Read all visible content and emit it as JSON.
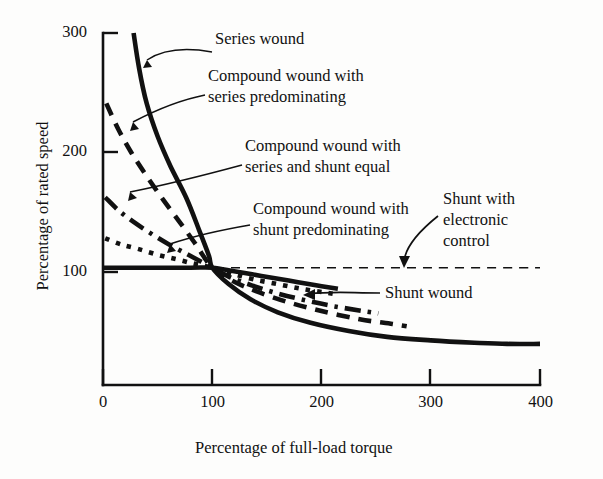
{
  "figure": {
    "background_color": "#fdfdfc",
    "ink_color": "#111111"
  },
  "chart_data": {
    "type": "line",
    "title": "",
    "xlabel": "Percentage of full-load torque",
    "ylabel": "Percentage of rated speed",
    "xlim": [
      0,
      400
    ],
    "ylim": [
      0,
      300
    ],
    "xticks": [
      0,
      100,
      200,
      300,
      400
    ],
    "yticks": [
      100,
      200,
      300
    ],
    "grid": false,
    "legend_position": "inline-annotations",
    "series": [
      {
        "name": "Series wound",
        "style": "solid",
        "width": "thick",
        "points": [
          [
            28,
            300
          ],
          [
            33,
            270
          ],
          [
            40,
            240
          ],
          [
            50,
            212
          ],
          [
            62,
            186
          ],
          [
            76,
            160
          ],
          [
            88,
            132
          ],
          [
            97,
            110
          ],
          [
            100,
            100
          ],
          [
            115,
            86
          ],
          [
            135,
            73
          ],
          [
            160,
            62
          ],
          [
            190,
            53
          ],
          [
            225,
            46
          ],
          [
            260,
            41
          ],
          [
            300,
            38
          ],
          [
            340,
            36
          ],
          [
            370,
            35
          ],
          [
            400,
            35
          ]
        ]
      },
      {
        "name": "Compound wound with series predominating",
        "style": "dashed",
        "width": "thick",
        "points": [
          [
            3,
            240
          ],
          [
            14,
            218
          ],
          [
            26,
            198
          ],
          [
            40,
            178
          ],
          [
            55,
            158
          ],
          [
            70,
            139
          ],
          [
            84,
            121
          ],
          [
            94,
            107
          ],
          [
            100,
            100
          ],
          [
            118,
            89
          ],
          [
            140,
            80
          ],
          [
            168,
            71
          ],
          [
            200,
            63
          ],
          [
            235,
            56
          ],
          [
            265,
            52
          ],
          [
            278,
            50
          ]
        ]
      },
      {
        "name": "Compound wound with series and shunt equal",
        "style": "dash-dot",
        "width": "thick",
        "points": [
          [
            2,
            160
          ],
          [
            14,
            149
          ],
          [
            28,
            139
          ],
          [
            44,
            129
          ],
          [
            60,
            120
          ],
          [
            76,
            112
          ],
          [
            90,
            105
          ],
          [
            100,
            100
          ],
          [
            116,
            92
          ],
          [
            136,
            85
          ],
          [
            160,
            78
          ],
          [
            186,
            72
          ],
          [
            212,
            67
          ],
          [
            238,
            63
          ],
          [
            252,
            61
          ]
        ]
      },
      {
        "name": "Compound wound with shunt predominating",
        "style": "dotted",
        "width": "thick",
        "points": [
          [
            2,
            125
          ],
          [
            16,
            120
          ],
          [
            32,
            116
          ],
          [
            50,
            111
          ],
          [
            68,
            107
          ],
          [
            85,
            103
          ],
          [
            100,
            100
          ],
          [
            118,
            95
          ],
          [
            138,
            90
          ],
          [
            160,
            86
          ],
          [
            182,
            82
          ],
          [
            202,
            79
          ],
          [
            215,
            77
          ]
        ]
      },
      {
        "name": "Shunt wound",
        "style": "solid",
        "width": "thick",
        "points": [
          [
            0,
            100
          ],
          [
            40,
            100
          ],
          [
            80,
            100
          ],
          [
            100,
            100
          ],
          [
            120,
            97
          ],
          [
            145,
            93
          ],
          [
            170,
            89
          ],
          [
            195,
            85
          ],
          [
            215,
            82
          ]
        ]
      },
      {
        "name": "Shunt with electronic control",
        "style": "dashed",
        "width": "thin",
        "points": [
          [
            0,
            100
          ],
          [
            100,
            100
          ],
          [
            200,
            100
          ],
          [
            300,
            100
          ],
          [
            400,
            100
          ]
        ]
      }
    ],
    "annotations": [
      {
        "id": "series-wound",
        "text": "Series wound",
        "target": [
          38,
          272
        ]
      },
      {
        "id": "compound-series-predominating",
        "text": "Compound wound with\nseries predominating",
        "target": [
          25,
          205
        ]
      },
      {
        "id": "compound-series-shunt-equal",
        "text": "Compound wound with\nseries and shunt equal",
        "target": [
          22,
          148
        ]
      },
      {
        "id": "compound-shunt-predominating",
        "text": "Compound wound with\nshunt predominating",
        "target": [
          55,
          112
        ]
      },
      {
        "id": "shunt-electronic-control",
        "text": "Shunt with\nelectronic\ncontrol",
        "target": [
          292,
          100
        ]
      },
      {
        "id": "shunt-wound",
        "text": "Shunt wound",
        "target": [
          175,
          86
        ]
      }
    ]
  },
  "axes": {
    "x_tick_labels": [
      "0",
      "100",
      "200",
      "300",
      "400"
    ],
    "y_tick_labels": [
      "100",
      "200",
      "300"
    ],
    "x_axis_title": "Percentage of full-load torque",
    "y_axis_title": "Percentage of rated speed"
  }
}
